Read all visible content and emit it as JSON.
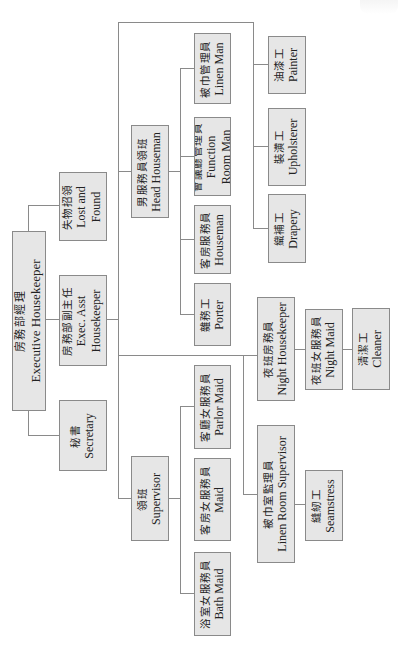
{
  "chart": {
    "orientation": "rotated-90-ccw",
    "nodes": {
      "executive_housekeeper": {
        "zh": "房務部經理",
        "en": "Executive Housekeeper"
      },
      "lost_and_found": {
        "zh": "失物招領",
        "en1": "Lost and",
        "en2": "Found"
      },
      "exec_asst_housekeeper": {
        "zh": "房務部副主任",
        "en1": "Exec. Asst",
        "en2": "Housekeeper"
      },
      "secretary": {
        "zh": "秘書",
        "en": "Secretary"
      },
      "head_houseman": {
        "zh": "男服務員領班",
        "en": "Head Houseman"
      },
      "supervisor": {
        "zh": "領班",
        "en": "Supervisor"
      },
      "linen_man": {
        "zh": "被巾管理員",
        "en": "Linen Man"
      },
      "function_room_man": {
        "zh": "會議廳管理員",
        "en1": "Function",
        "en2": "Room Man"
      },
      "houseman": {
        "zh": "客房服務員",
        "en": "Houseman"
      },
      "porter": {
        "zh": "雜務工",
        "en": "Porter"
      },
      "parlor_maid": {
        "zh": "客廳女服務員",
        "en": "Parlor Maid"
      },
      "maid": {
        "zh": "客房女服務員",
        "en": "Maid"
      },
      "bath_maid": {
        "zh": "浴室女服務員",
        "en": "Bath Maid"
      },
      "painter": {
        "zh": "油漆工",
        "en": "Painter"
      },
      "upholsterer": {
        "zh": "裝潢工",
        "en": "Upholsterer"
      },
      "drapery": {
        "zh": "織補工",
        "en": "Drapery"
      },
      "night_housekeeper": {
        "zh": "夜班房務員",
        "en": "Night Housekeeper"
      },
      "night_maid": {
        "zh": "夜班女服務員",
        "en": "Night Maid"
      },
      "cleaner": {
        "zh": "清潔工",
        "en": "Cleaner"
      },
      "linen_room_supervisor": {
        "zh": "被巾室監理員",
        "en": "Linen Room Supervisor"
      },
      "seamstress": {
        "zh": "縫紉工",
        "en": "Seamstress"
      }
    },
    "hierarchy": [
      {
        "parent": "Executive Housekeeper",
        "children": [
          "Lost and Found",
          "Exec. Asst Housekeeper",
          "Secretary"
        ]
      },
      {
        "parent": "Exec. Asst Housekeeper",
        "children": [
          "Head Houseman",
          "Supervisor",
          "Night Housekeeper",
          "Linen Room Supervisor",
          "Painter",
          "Upholsterer",
          "Drapery"
        ]
      },
      {
        "parent": "Head Houseman",
        "children": [
          "Linen Man",
          "Function Room Man",
          "Houseman",
          "Porter"
        ]
      },
      {
        "parent": "Supervisor",
        "children": [
          "Parlor Maid",
          "Maid",
          "Bath Maid"
        ]
      },
      {
        "parent": "Night Housekeeper",
        "children": [
          "Night Maid"
        ]
      },
      {
        "parent": "Night Maid",
        "children": [
          "Cleaner"
        ]
      },
      {
        "parent": "Linen Room Supervisor",
        "children": [
          "Seamstress"
        ]
      }
    ],
    "colors": {
      "box_fill": "#e6e6e6",
      "box_border": "#8a8a8a",
      "line": "#8a8a8a",
      "background": "#ffffff"
    }
  }
}
